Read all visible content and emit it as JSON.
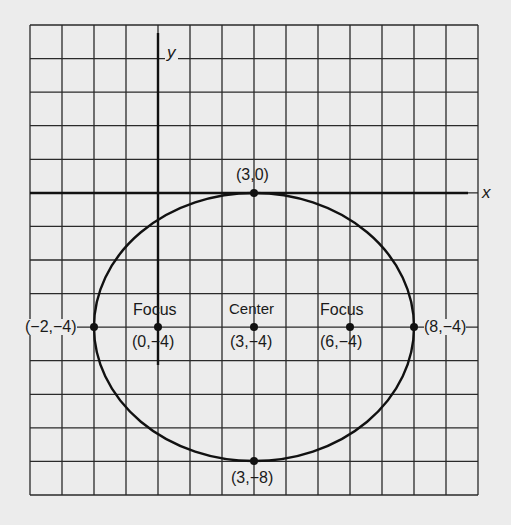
{
  "diagram": {
    "type": "ellipse-on-coordinate-grid",
    "grid": {
      "columns": 14,
      "rows": 14,
      "x_range": [
        -4,
        10
      ],
      "y_range": [
        -9,
        5
      ]
    },
    "axes": {
      "x_label": "x",
      "y_label": "y"
    },
    "ellipse": {
      "center": [
        3,
        -4
      ],
      "semi_major": 5,
      "semi_minor": 4,
      "orientation": "horizontal"
    },
    "points": [
      {
        "id": "top-vertex",
        "coords": [
          3,
          0
        ],
        "label": "(3,0)"
      },
      {
        "id": "bottom-vertex",
        "coords": [
          3,
          -8
        ],
        "label": "(3,−8)"
      },
      {
        "id": "left-vertex",
        "coords": [
          -2,
          -4
        ],
        "label": "(−2,−4)"
      },
      {
        "id": "right-vertex",
        "coords": [
          8,
          -4
        ],
        "label": "(8,−4)"
      },
      {
        "id": "left-focus",
        "coords": [
          0,
          -4
        ],
        "title": "Focus",
        "label": "(0,−4)"
      },
      {
        "id": "center",
        "coords": [
          3,
          -4
        ],
        "title": "Center",
        "label": "(3,−4)"
      },
      {
        "id": "right-focus",
        "coords": [
          6,
          -4
        ],
        "title": "Focus",
        "label": "(6,−4)"
      }
    ]
  },
  "colors": {
    "background": "#ececec",
    "ink": "#1a1a1a"
  }
}
